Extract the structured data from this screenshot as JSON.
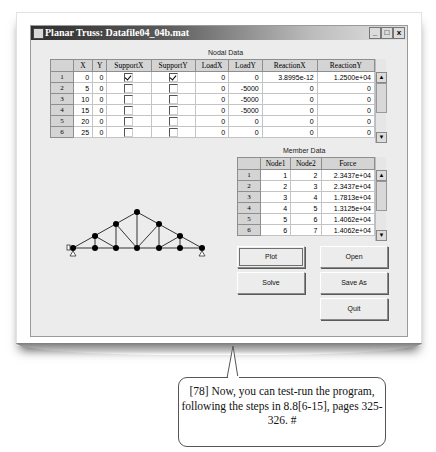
{
  "window": {
    "title": "Planar Truss: Datafile04_04b.mat",
    "controls": {
      "minimize": "_",
      "maximize": "□",
      "close": "x"
    }
  },
  "nodal": {
    "label": "Nodal Data",
    "columns": [
      "",
      "X",
      "Y",
      "SupportX",
      "SupportY",
      "LoadX",
      "LoadY",
      "ReactionX",
      "ReactionY"
    ],
    "rows": [
      {
        "id": "1",
        "x": "0",
        "y": "0",
        "supportX": true,
        "supportY": true,
        "loadX": "0",
        "loadY": "0",
        "reactionX": "3.8995e-12",
        "reactionY": "1.2500e+04"
      },
      {
        "id": "2",
        "x": "5",
        "y": "0",
        "supportX": false,
        "supportY": false,
        "loadX": "0",
        "loadY": "-5000",
        "reactionX": "0",
        "reactionY": "0"
      },
      {
        "id": "3",
        "x": "10",
        "y": "0",
        "supportX": false,
        "supportY": false,
        "loadX": "0",
        "loadY": "-5000",
        "reactionX": "0",
        "reactionY": "0"
      },
      {
        "id": "4",
        "x": "15",
        "y": "0",
        "supportX": false,
        "supportY": false,
        "loadX": "0",
        "loadY": "-5000",
        "reactionX": "0",
        "reactionY": "0"
      },
      {
        "id": "5",
        "x": "20",
        "y": "0",
        "supportX": false,
        "supportY": false,
        "loadX": "0",
        "loadY": "0",
        "reactionX": "0",
        "reactionY": "0"
      },
      {
        "id": "6",
        "x": "25",
        "y": "0",
        "supportX": false,
        "supportY": false,
        "loadX": "0",
        "loadY": "0",
        "reactionX": "0",
        "reactionY": "0"
      }
    ]
  },
  "member": {
    "label": "Member Data",
    "columns": [
      "",
      "Node1",
      "Node2",
      "Force"
    ],
    "rows": [
      {
        "id": "1",
        "node1": "1",
        "node2": "2",
        "force": "2.3437e+04"
      },
      {
        "id": "2",
        "node1": "2",
        "node2": "3",
        "force": "2.3437e+04"
      },
      {
        "id": "3",
        "node1": "3",
        "node2": "4",
        "force": "1.7813e+04"
      },
      {
        "id": "4",
        "node1": "4",
        "node2": "5",
        "force": "1.3125e+04"
      },
      {
        "id": "5",
        "node1": "5",
        "node2": "6",
        "force": "1.4062e+04"
      },
      {
        "id": "6",
        "node1": "6",
        "node2": "7",
        "force": "1.4062e+04"
      }
    ]
  },
  "scroll_icons": {
    "up": "▲",
    "down": "▼"
  },
  "buttons": {
    "plot": "Plot",
    "open": "Open",
    "solve": "Solve",
    "save_as": "Save As",
    "quit": "Quit"
  },
  "truss_plot": {
    "icon": "truss-diagram",
    "bottom_nodes": 7,
    "top_nodes": 5,
    "supports": [
      "left",
      "right"
    ]
  },
  "callout": {
    "text": "[78] Now, you can test-run the program, following the steps in 8.8[6-15], pages 325-326.  #"
  }
}
